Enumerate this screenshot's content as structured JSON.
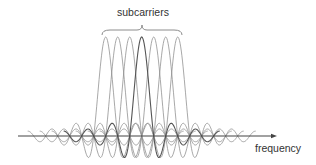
{
  "title_label": "subcarriers",
  "axis_label": "frequency",
  "colors": {
    "background": "#ffffff",
    "subcarrier": "#8c8c8c",
    "center_subcarrier": "#555555",
    "axis": "#444444",
    "text": "#333333"
  },
  "chart_data": {
    "type": "line",
    "title": "subcarriers",
    "xlabel": "frequency",
    "ylabel": "",
    "subcarrier_count": 7,
    "series": [
      {
        "name": "subcarrier 1",
        "center": -3,
        "amplitude": 1.0
      },
      {
        "name": "subcarrier 2",
        "center": -2,
        "amplitude": 1.0
      },
      {
        "name": "subcarrier 3",
        "center": -1,
        "amplitude": 1.0
      },
      {
        "name": "subcarrier 4",
        "center": 0,
        "amplitude": 1.0,
        "highlighted": true
      },
      {
        "name": "subcarrier 5",
        "center": 1,
        "amplitude": 1.0
      },
      {
        "name": "subcarrier 6",
        "center": 2,
        "amplitude": 1.0
      },
      {
        "name": "subcarrier 7",
        "center": 3,
        "amplitude": 1.0
      }
    ],
    "function": "sinc",
    "sidelobe_extent": 6.5,
    "grid": false,
    "legend": false
  },
  "geometry": {
    "center_x": 141.7,
    "spacing_px": 12,
    "axis_y": 136,
    "peak_height_px": 99,
    "axis_start_x": 18,
    "axis_end_x": 277,
    "brace": {
      "x1": 102,
      "x2": 182,
      "y_top": 25,
      "y_bottom": 35,
      "tip_x": 142
    }
  }
}
